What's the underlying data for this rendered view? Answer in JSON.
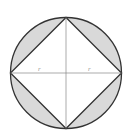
{
  "diagram": {
    "labels": {
      "left_radius": "r",
      "right_radius": "r"
    },
    "colors": {
      "stroke": "#333333",
      "shade": "#d9d9d9",
      "background": "#ffffff",
      "axis": "#888888"
    }
  }
}
